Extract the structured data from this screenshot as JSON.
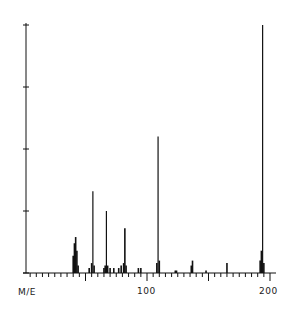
{
  "chart_data": {
    "type": "bar",
    "title": "",
    "xlabel": "M/E",
    "ylabel": "Relative abundance",
    "xlim": [
      2,
      206
    ],
    "ylim": [
      0,
      100
    ],
    "x_tick_labels": [
      "100",
      "200"
    ],
    "x_minor_tick_step": 5,
    "y_ticks": [
      0,
      25,
      50,
      75,
      100
    ],
    "grid": false,
    "legend": null,
    "peaks": [
      {
        "mz": 40,
        "intensity": 7
      },
      {
        "mz": 41,
        "intensity": 12
      },
      {
        "mz": 42,
        "intensity": 14.5
      },
      {
        "mz": 43,
        "intensity": 9
      },
      {
        "mz": 44,
        "intensity": 3
      },
      {
        "mz": 53,
        "intensity": 2
      },
      {
        "mz": 55,
        "intensity": 4
      },
      {
        "mz": 56,
        "intensity": 33
      },
      {
        "mz": 57,
        "intensity": 3
      },
      {
        "mz": 65,
        "intensity": 2
      },
      {
        "mz": 66,
        "intensity": 3
      },
      {
        "mz": 67,
        "intensity": 25
      },
      {
        "mz": 68,
        "intensity": 3
      },
      {
        "mz": 70,
        "intensity": 2
      },
      {
        "mz": 73,
        "intensity": 2
      },
      {
        "mz": 77,
        "intensity": 2
      },
      {
        "mz": 79,
        "intensity": 3
      },
      {
        "mz": 81,
        "intensity": 4
      },
      {
        "mz": 82,
        "intensity": 18
      },
      {
        "mz": 83,
        "intensity": 3
      },
      {
        "mz": 93,
        "intensity": 2
      },
      {
        "mz": 95,
        "intensity": 2
      },
      {
        "mz": 108,
        "intensity": 4
      },
      {
        "mz": 109,
        "intensity": 55
      },
      {
        "mz": 110,
        "intensity": 5
      },
      {
        "mz": 123,
        "intensity": 1
      },
      {
        "mz": 124,
        "intensity": 1
      },
      {
        "mz": 136,
        "intensity": 3
      },
      {
        "mz": 137,
        "intensity": 5
      },
      {
        "mz": 148,
        "intensity": 1
      },
      {
        "mz": 165,
        "intensity": 4
      },
      {
        "mz": 192,
        "intensity": 5
      },
      {
        "mz": 193,
        "intensity": 9
      },
      {
        "mz": 194,
        "intensity": 100
      },
      {
        "mz": 195,
        "intensity": 4
      }
    ]
  },
  "labels": {
    "x_axis": "M/E",
    "tick_100": "100",
    "tick_200": "200"
  }
}
